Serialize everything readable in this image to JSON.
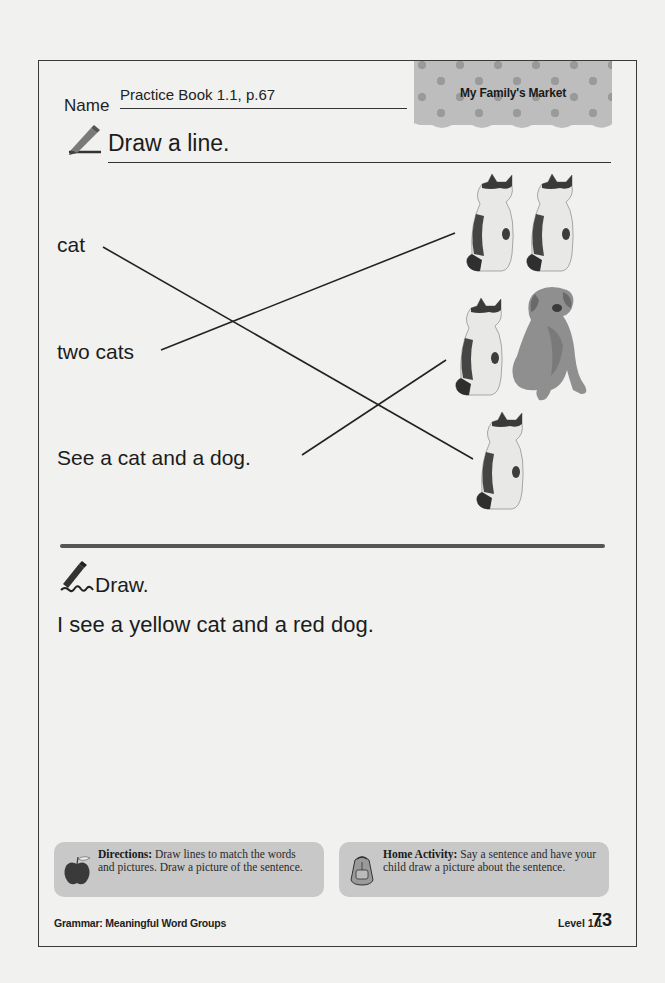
{
  "header": {
    "name_label": "Name",
    "name_value": "Practice Book 1.1, p.67",
    "banner_title": "My Family's Market"
  },
  "section1": {
    "icon": "pencil-icon",
    "title": "Draw a line.",
    "words": [
      "cat",
      "two cats",
      "See a cat and a dog."
    ],
    "pictures": [
      {
        "name": "two-cats-picture",
        "content": [
          "cat",
          "cat"
        ]
      },
      {
        "name": "cat-and-dog-picture",
        "content": [
          "cat",
          "dog"
        ]
      },
      {
        "name": "one-cat-picture",
        "content": [
          "cat"
        ]
      }
    ],
    "matches": [
      {
        "word": "cat",
        "picture": "one-cat-picture"
      },
      {
        "word": "two cats",
        "picture": "two-cats-picture"
      },
      {
        "word": "See a cat and a dog.",
        "picture": "cat-and-dog-picture"
      }
    ]
  },
  "section2": {
    "icon": "pencil-writing-icon",
    "title": "Draw.",
    "prompt": "I see a yellow cat and a red dog."
  },
  "notes": {
    "directions": {
      "icon": "apple-icon",
      "label": "Directions:",
      "text": " Draw lines to match the words and pictures. Draw a picture of the sentence."
    },
    "home": {
      "icon": "backpack-icon",
      "label": "Home Activity:",
      "text": " Say a sentence and have your child draw a picture about the sentence."
    }
  },
  "footer": {
    "topic": "Grammar: Meaningful Word Groups",
    "level": "Level 1.1",
    "page": "73"
  },
  "colors": {
    "page": "#f1f1ef",
    "ink": "#1c1c1c",
    "note_bg": "#c8c8c8",
    "banner_bg": "#bdbdbd"
  }
}
